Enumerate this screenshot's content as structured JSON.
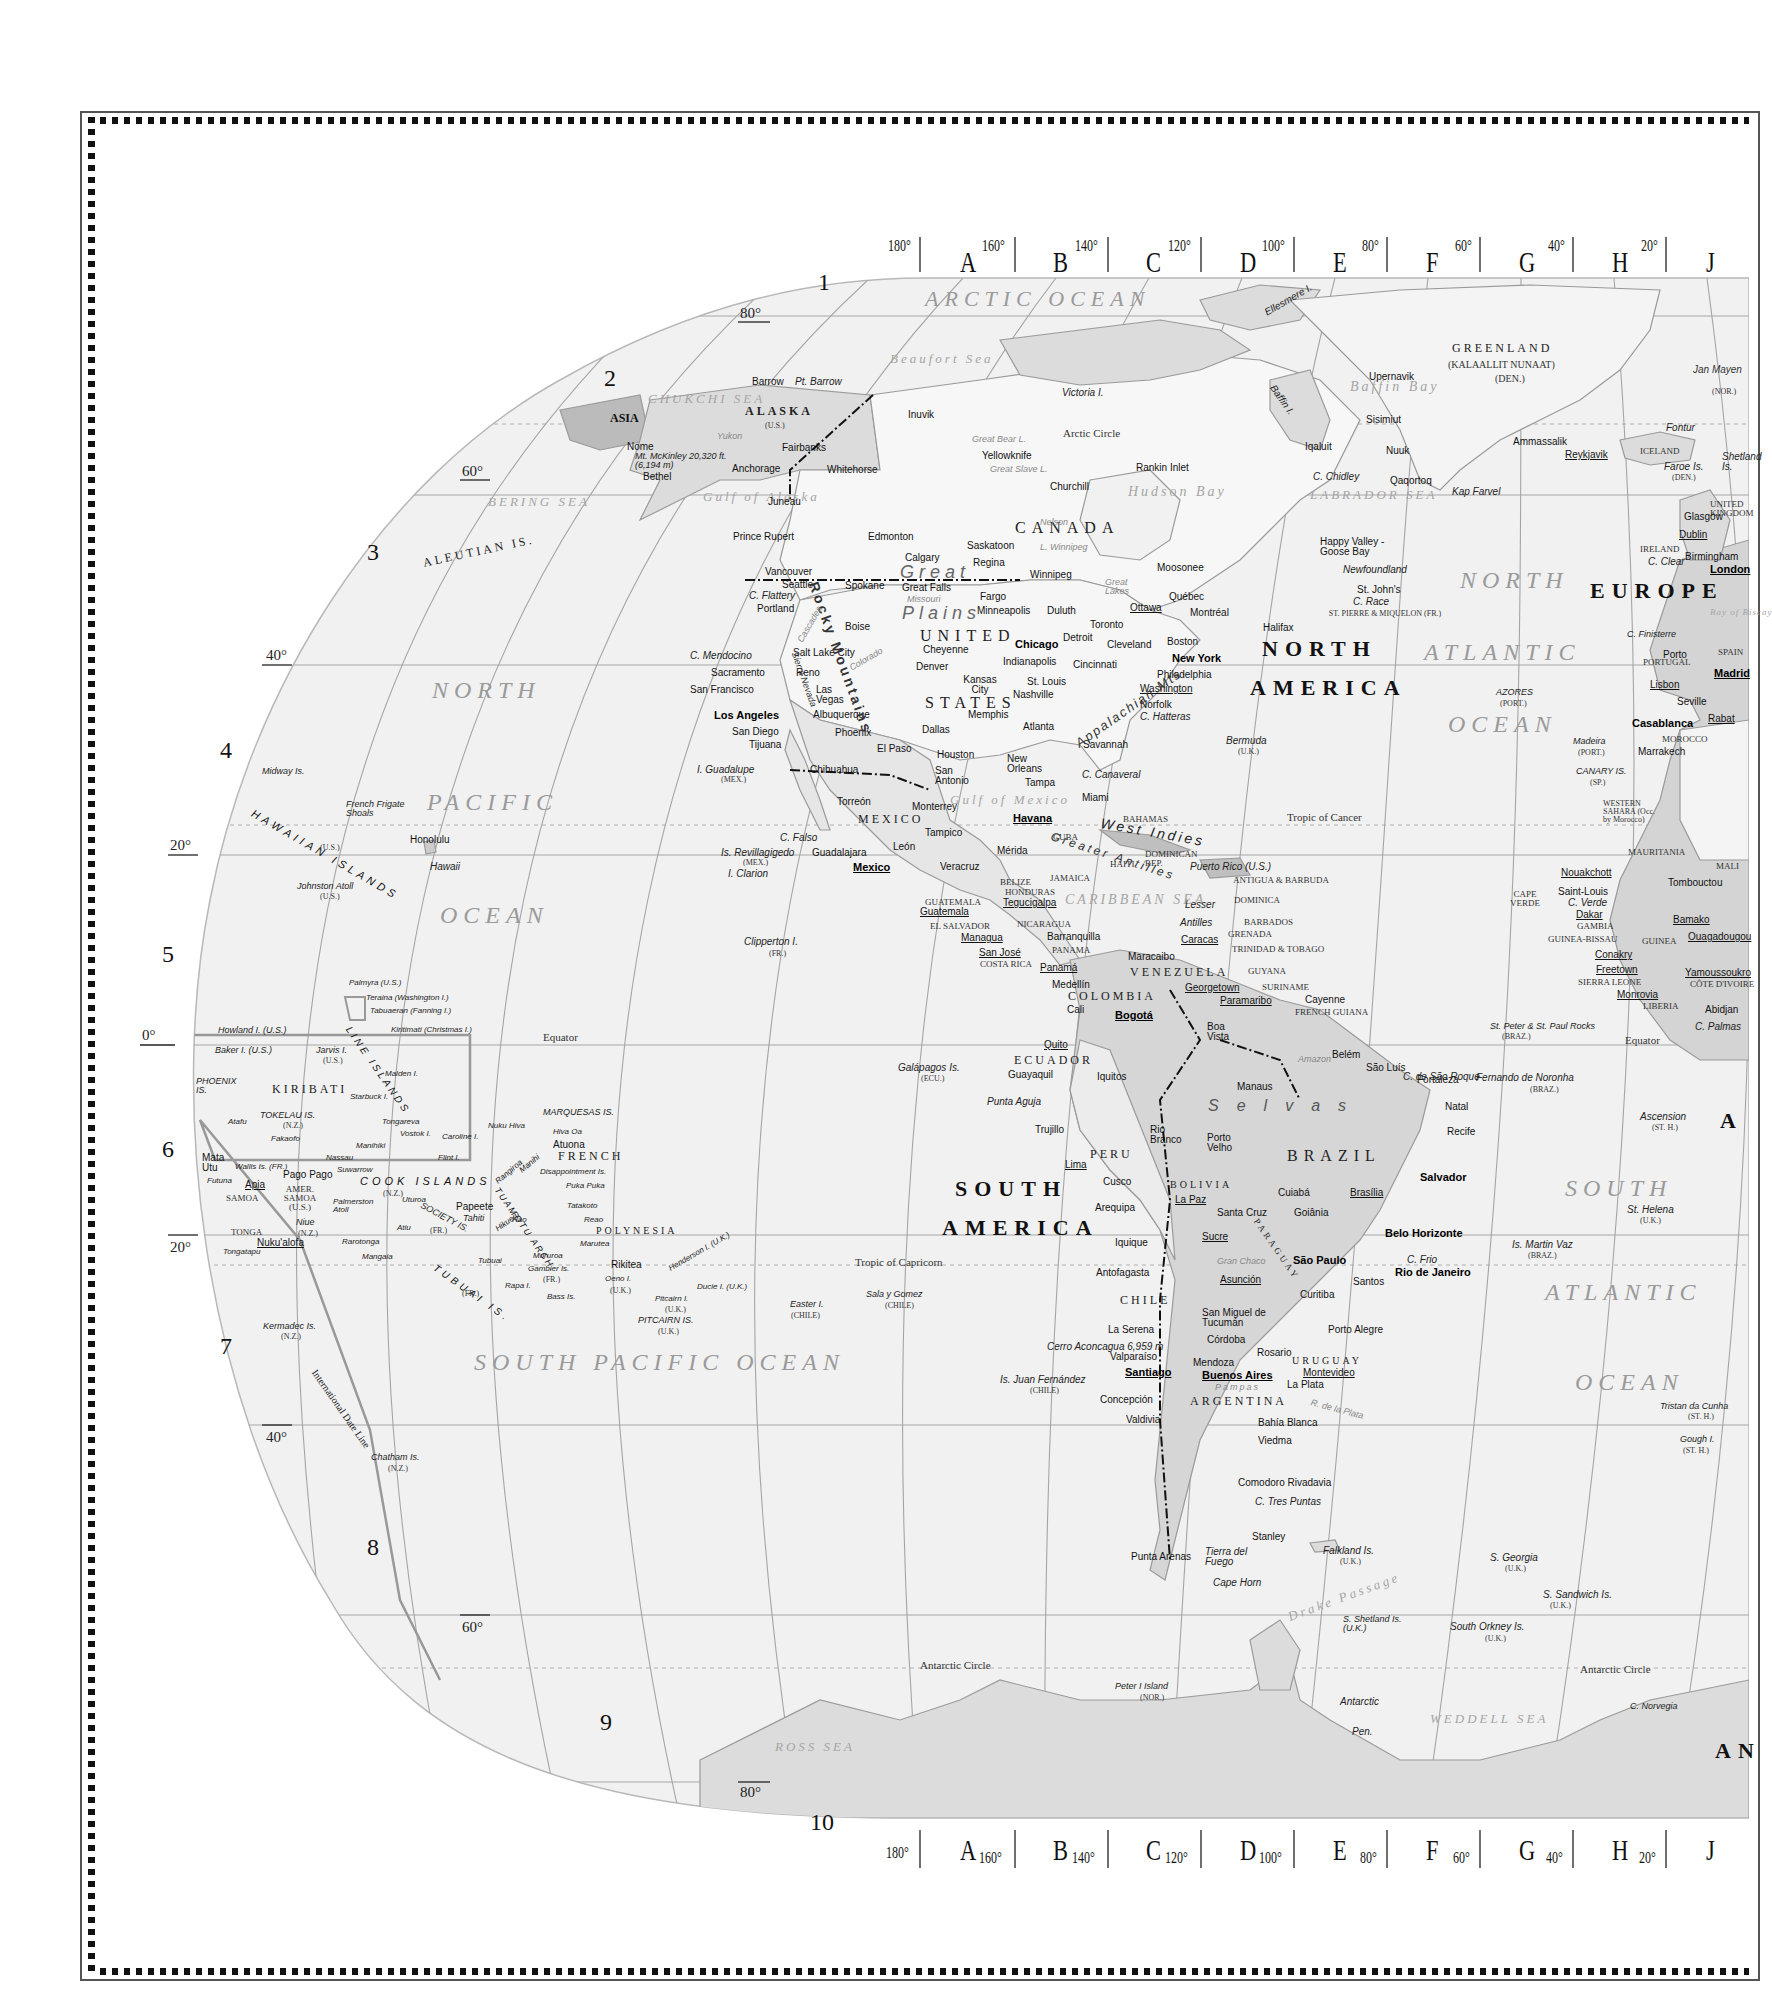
{
  "map": {
    "type": "world map (Western Hemisphere section)",
    "grid_columns": {
      "letters": [
        "A",
        "B",
        "C",
        "D",
        "E",
        "F",
        "G",
        "H",
        "J"
      ],
      "top_degrees": [
        "180°",
        "160°",
        "140°",
        "120°",
        "100°",
        "80°",
        "60°",
        "40°",
        "20°"
      ],
      "bottom_degrees": [
        "180°",
        "160°",
        "140°",
        "120°",
        "100°",
        "80°",
        "60°",
        "40°",
        "20°"
      ]
    },
    "grid_rows": [
      "1",
      "2",
      "3",
      "4",
      "5",
      "6",
      "7",
      "8",
      "9",
      "10"
    ],
    "latitude_labels": {
      "n80": "80°",
      "n60": "60°",
      "n40": "40°",
      "n20": "20°",
      "eq": "0°",
      "s20": "20°",
      "s40": "40°",
      "s60": "60°",
      "s80": "80°"
    },
    "lines": {
      "arctic_circle": "Arctic Circle",
      "tropic_cancer": "Tropic of Cancer",
      "equator": "Equator",
      "tropic_capricorn": "Tropic of Capricorn",
      "antarctic_circle": "Antarctic Circle",
      "date_line": "International Date Line"
    },
    "continents": {
      "north_america_1": "NORTH",
      "north_america_2": "AMERICA",
      "south_america_1": "SOUTH",
      "south_america_2": "AMERICA",
      "europe": "EUROPE",
      "asia": "ASIA",
      "africa_partial": "A",
      "antarctica_partial": "AN"
    },
    "oceans": {
      "arctic": "ARCTIC OCEAN",
      "north_pacific_1": "NORTH",
      "north_pacific_2": "PACIFIC",
      "north_pacific_3": "OCEAN",
      "south_pacific": "SOUTH PACIFIC OCEAN",
      "north_atlantic_1": "NORTH",
      "north_atlantic_2": "ATLANTIC",
      "north_atlantic_3": "OCEAN",
      "south_atlantic_1": "SOUTH",
      "south_atlantic_2": "ATLANTIC",
      "south_atlantic_3": "OCEAN"
    },
    "seas": {
      "beaufort": "Beaufort Sea",
      "chukchi": "CHUKCHI SEA",
      "bering": "BERING SEA",
      "gulf_alaska": "Gulf of Alaska",
      "hudson": "Hudson Bay",
      "baffin": "Baffin Bay",
      "labrador": "LABRADOR SEA",
      "gulf_mexico": "Gulf of Mexico",
      "caribbean": "CARIBBEAN SEA",
      "weddell": "WEDDELL SEA",
      "ross": "ROSS SEA",
      "drake": "Drake Passage",
      "biscay": "Bay of Biscay"
    },
    "countries": {
      "canada": "CANADA",
      "united": "UNITED",
      "states": "STATES",
      "alaska": "ALASKA",
      "alaska_us": "(U.S.)",
      "greenland": "GREENLAND",
      "greenland_alt": "(KALAALLIT NUNAAT)",
      "greenland_den": "(DEN.)",
      "iceland": "ICELAND",
      "mexico": "MEXICO",
      "cuba": "CUBA",
      "bahamas": "BAHAMAS",
      "haiti": "HAITI",
      "dominican_rep": "DOMINICAN REP.",
      "jamaica": "JAMAICA",
      "belize": "BELIZE",
      "honduras": "HONDURAS",
      "guatemala": "GUATEMALA",
      "el_salvador": "EL SALVADOR",
      "nicaragua": "NICARAGUA",
      "costa_rica": "COSTA RICA",
      "panama": "PANAMA",
      "colombia": "COLOMBIA",
      "venezuela": "VENEZUELA",
      "guyana": "GUYANA",
      "suriname": "SURINAME",
      "french_guiana": "FRENCH GUIANA",
      "ecuador": "ECUADOR",
      "peru": "PERU",
      "brazil": "BRAZIL",
      "bolivia": "BOLIVIA",
      "paraguay": "PARAGUAY",
      "chile": "CHILE",
      "argentina": "ARGENTINA",
      "uruguay": "URUGUAY",
      "ireland": "IRELAND",
      "united_kingdom": "UNITED KINGDOM",
      "portugal": "PORTUGAL",
      "spain": "SPAIN",
      "morocco": "MOROCCO",
      "western_sahara": "WESTERN SAHARA (Occ. by Morocco)",
      "mauritania": "MAURITANIA",
      "mali": "MALI",
      "cape_verde": "CAPE VERDE",
      "gambia": "GAMBIA",
      "guinea_bissau": "GUINEA-BISSAU",
      "guinea": "GUINEA",
      "sierra_leone": "SIERRA LEONE",
      "liberia": "LIBERIA",
      "cote_divoire": "CÔTE D'IVOIRE",
      "kiribati": "KIRIBATI",
      "french_polynesia_1": "FRENCH",
      "french_polynesia_2": "POLYNESIA",
      "samoa": "SAMOA",
      "amer_samoa": "AMER. SAMOA (U.S.)",
      "tonga": "TONGA",
      "antigua": "ANTIGUA & BARBUDA",
      "dominica": "DOMINICA",
      "barbados": "BARBADOS",
      "grenada": "GRENADA",
      "trinidad": "TRINIDAD & TOBAGO",
      "st_pierre": "ST. PIERRE & MIQUELON (FR.)"
    },
    "cities": {
      "barrow": "Barrow",
      "nome": "Nome",
      "bethel": "Bethel",
      "anchorage": "Anchorage",
      "fairbanks": "Fairbanks",
      "juneau": "Juneau",
      "whitehorse": "Whitehorse",
      "inuvik": "Inuvik",
      "yellowknife": "Yellowknife",
      "prince_rupert": "Prince Rupert",
      "edmonton": "Edmonton",
      "calgary": "Calgary",
      "saskatoon": "Saskatoon",
      "regina": "Regina",
      "winnipeg": "Winnipeg",
      "churchill": "Churchill",
      "rankin_inlet": "Rankin Inlet",
      "iqaluit": "Iqaluit",
      "moosonee": "Moosonee",
      "quebec": "Québec",
      "ottawa": "Ottawa",
      "montreal": "Montréal",
      "toronto": "Toronto",
      "halifax": "Halifax",
      "st_johns": "St. John's",
      "happy_valley": "Happy Valley - Goose Bay",
      "vancouver": "Vancouver",
      "seattle": "Seattle",
      "spokane": "Spokane",
      "portland": "Portland",
      "great_falls": "Great Falls",
      "fargo": "Fargo",
      "minneapolis": "Minneapolis",
      "duluth": "Duluth",
      "boise": "Boise",
      "salt_lake": "Salt Lake City",
      "cheyenne": "Cheyenne",
      "denver": "Denver",
      "reno": "Reno",
      "sacramento": "Sacramento",
      "san_francisco": "San Francisco",
      "las_vegas": "Las Vegas",
      "los_angeles": "Los Angeles",
      "san_diego": "San Diego",
      "tijuana": "Tijuana",
      "phoenix": "Phoenix",
      "albuquerque": "Albuquerque",
      "el_paso": "El Paso",
      "kansas_city": "Kansas City",
      "st_louis": "St. Louis",
      "chicago": "Chicago",
      "detroit": "Detroit",
      "cleveland": "Cleveland",
      "indianapolis": "Indianapolis",
      "cincinnati": "Cincinnati",
      "nashville": "Nashville",
      "memphis": "Memphis",
      "dallas": "Dallas",
      "houston": "Houston",
      "san_antonio": "San Antonio",
      "new_orleans": "New Orleans",
      "atlanta": "Atlanta",
      "savannah": "Savannah",
      "tampa": "Tampa",
      "miami": "Miami",
      "norfolk": "Norfolk",
      "washington": "Washington",
      "philadelphia": "Philadelphia",
      "new_york": "New York",
      "boston": "Boston",
      "chihuahua": "Chihuahua",
      "torreon": "Torreón",
      "monterrey": "Monterrey",
      "tampico": "Tampico",
      "guadalajara": "Guadalajara",
      "leon": "León",
      "mexico_city": "Mexico",
      "veracruz": "Veracruz",
      "merida": "Mérida",
      "havana": "Havana",
      "guatemala": "Guatemala",
      "tegucigalpa": "Tegucigalpa",
      "managua": "Managua",
      "san_jose": "San José",
      "panama": "Panamá",
      "barranquilla": "Barranquilla",
      "maracaibo": "Maracaibo",
      "caracas": "Caracas",
      "medellin": "Medellín",
      "cali": "Cali",
      "bogota": "Bogotá",
      "georgetown": "Georgetown",
      "paramaribo": "Paramaribo",
      "cayenne": "Cayenne",
      "quito": "Quito",
      "guayaquil": "Guayaquil",
      "iquitos": "Iquitos",
      "boa_vista": "Boa Vista",
      "manaus": "Manaus",
      "belem": "Belém",
      "sao_luis": "São Luís",
      "fortaleza": "Fortaleza",
      "natal": "Natal",
      "recife": "Recife",
      "salvador": "Salvador",
      "trujillo": "Trujillo",
      "lima": "Lima",
      "cusco": "Cusco",
      "arequipa": "Arequipa",
      "rio_branco": "Rio Branco",
      "porto_velho": "Porto Velho",
      "la_paz": "La Paz",
      "santa_cruz": "Santa Cruz",
      "sucre": "Sucre",
      "cuiaba": "Cuiabá",
      "brasilia": "Brasília",
      "goiania": "Goiânia",
      "belo_horizonte": "Belo Horizonte",
      "sao_paulo": "São Paulo",
      "rio": "Rio de Janeiro",
      "santos": "Santos",
      "curitiba": "Curitiba",
      "porto_alegre": "Porto Alegre",
      "iquique": "Iquique",
      "antofagasta": "Antofagasta",
      "asuncion": "Asunción",
      "tucuman": "San Miguel de Tucumán",
      "cordoba": "Córdoba",
      "la_serena": "La Serena",
      "valparaiso": "Valparaíso",
      "santiago": "Santiago",
      "mendoza": "Mendoza",
      "rosario": "Rosario",
      "buenos_aires": "Buenos Aires",
      "montevideo": "Montevideo",
      "la_plata": "La Plata",
      "concepcion": "Concepción",
      "valdivia": "Valdivia",
      "bahia_blanca": "Bahía Blanca",
      "viedma": "Viedma",
      "comodoro": "Comodoro Rivadavia",
      "punta_arenas": "Punta Arenas",
      "stanley": "Stanley",
      "upernavik": "Upernavik",
      "sisimiut": "Sisimiut",
      "nuuk": "Nuuk",
      "qaqortoq": "Qaqortoq",
      "ammassalik": "Ammassalik",
      "reykjavik": "Reykjavik",
      "glasgow": "Glasgow",
      "dublin": "Dublin",
      "birmingham": "Birmingham",
      "london": "London",
      "porto": "Porto",
      "lisbon": "Lisbon",
      "seville": "Seville",
      "madrid": "Madrid",
      "casablanca": "Casablanca",
      "rabat": "Rabat",
      "marrakech": "Marrakech",
      "nouakchott": "Nouakchott",
      "saint_louis": "Saint-Louis",
      "dakar": "Dakar",
      "tombouctou": "Tombouctou",
      "bamako": "Bamako",
      "ouagadougou": "Ouagadougou",
      "conakry": "Conakry",
      "freetown": "Freetown",
      "monrovia": "Monrovia",
      "yamoussoukro": "Yamoussoukro",
      "abidjan": "Abidjan",
      "honolulu": "Honolulu",
      "papeete": "Papeete",
      "atuona": "Atuona",
      "apia": "Apia",
      "pago_pago": "Pago Pago",
      "nukualofa": "Nuku'alofa",
      "mata_utu": "Mata Utu",
      "rikitea": "Rikitea"
    },
    "features": {
      "mckinley": "Mt. McKinley 20,320 ft. (6,194 m)",
      "pt_barrow": "Pt. Barrow",
      "aleutian": "ALEUTIAN IS.",
      "victoria_i": "Victoria I.",
      "ellesmere": "Ellesmere I.",
      "baffin_i": "Baffin I.",
      "c_chidley": "C. Chidley",
      "kap_farvel": "Kap Farvel",
      "newfoundland": "Newfoundland",
      "c_race": "C. Race",
      "jan_mayen": "Jan Mayen",
      "jan_mayen_nor": "(NOR.)",
      "fontur": "Fontur",
      "faroe": "Faroe Is.",
      "faroe_den": "(DEN.)",
      "c_clear": "C. Clear",
      "great_bear": "Great Bear L.",
      "great_slave": "Great Slave L.",
      "l_winnipeg": "L. Winnipeg",
      "great_lakes": "Great Lakes",
      "great_plains_1": "Great",
      "great_plains_2": "Plains",
      "rocky_mts": "Rocky Mountains",
      "cascades": "Cascades",
      "sierra_nevada": "Sierra Nevada",
      "appalachian": "Appalachian Mts.",
      "c_flattery": "C. Flattery",
      "c_mendocino": "C. Mendocino",
      "c_hatteras": "C. Hatteras",
      "c_canaveral": "C. Canaveral",
      "bermuda": "Bermuda",
      "bermuda_uk": "(U.K.)",
      "i_guadalupe": "I. Guadalupe",
      "i_guadalupe_mex": "(MEX.)",
      "c_falso": "C. Falso",
      "revillagigedo": "Is. Revillagigedo",
      "revillagigedo_mex": "(MEX.)",
      "i_clarion": "I. Clarion",
      "west_indies": "West Indies",
      "greater_antilles": "Greater Antilles",
      "lesser_antilles_1": "Lesser",
      "lesser_antilles_2": "Antilles",
      "puerto_rico": "Puerto Rico (U.S.)",
      "clipperton": "Clipperton I.",
      "clipperton_fr": "(FR.)",
      "galapagos": "Galápagos Is.",
      "galapagos_ecu": "(ECU.)",
      "punta_aguja": "Punta Aguja",
      "andes": "Andes",
      "selvas": "Selvas",
      "amazon": "Amazon",
      "gran_chaco": "Gran Chaco",
      "pampas": "Pampas",
      "aconcagua": "Cerro Aconcagua 6,959 m",
      "juan_fernandez": "Is. Juan Fernández",
      "juan_fernandez_chile": "(CHILE)",
      "rio_de_la_plata": "R. de la Plata",
      "c_tres_puntas": "C. Tres Puntas",
      "tierra_del_fuego": "Tierra del Fuego",
      "cape_horn": "Cape Horn",
      "falkland": "Falkland Is.",
      "falkland_uk": "(U.K.)",
      "s_georgia": "S. Georgia",
      "s_georgia_uk": "(U.K.)",
      "s_sandwich": "S. Sandwich Is.",
      "s_sandwich_uk": "(U.K.)",
      "s_shetland": "S. Shetland Is. (U.K.)",
      "s_orkney": "South Orkney Is.",
      "s_orkney_uk": "(U.K.)",
      "peter_i": "Peter I Island",
      "peter_i_nor": "(NOR.)",
      "antarctic_pen_1": "Antarctic",
      "antarctic_pen_2": "Pen.",
      "c_norvegia": "C. Norvegia",
      "c_frio": "C. Frio",
      "c_sao_roque": "C. de São Roque",
      "fernando_noronha": "Fernando de Noronha",
      "fernando_noronha_braz": "(BRAZ.)",
      "st_peter_paul": "St. Peter & St. Paul Rocks",
      "st_peter_paul_braz": "(BRAZ.)",
      "ascension": "Ascension",
      "ascension_sth": "(ST. H.)",
      "st_helena": "St. Helena",
      "st_helena_uk": "(U.K.)",
      "martin_vaz": "Is. Martin Vaz",
      "martin_vaz_braz": "(BRAZ.)",
      "tristan": "Tristan da Cunha",
      "tristan_sth": "(ST. H.)",
      "gough": "Gough I.",
      "gough_sth": "(ST. H.)",
      "azores": "AZORES",
      "azores_port": "(PORT.)",
      "madeira": "Madeira",
      "madeira_port": "(PORT.)",
      "canary": "CANARY IS.",
      "canary_sp": "(SP.)",
      "c_finisterre": "C. Finisterre",
      "c_verde": "C. Verde",
      "c_palmas": "C. Palmas",
      "atlas": "Atlas",
      "shetland": "Shetland Is.",
      "midway": "Midway Is.",
      "hawaiian": "HAWAIIAN ISLANDS",
      "hawaiian_us": "(U.S.)",
      "french_frigate": "French Frigate Shoals",
      "hawaii": "Hawaii",
      "johnston": "Johnston Atoll",
      "johnston_us": "(U.S.)",
      "palmyra": "Palmyra (U.S.)",
      "teraina": "Teraina (Washington I.)",
      "tabuaeran": "Tabuaeran (Fanning I.)",
      "kiritimati": "Kiritimati (Christmas I.)",
      "howland": "Howland I. (U.S.)",
      "baker": "Baker I. (U.S.)",
      "jarvis": "Jarvis I.",
      "jarvis_us": "(U.S.)",
      "line_islands": "LINE ISLANDS",
      "phoenix": "PHOENIX IS.",
      "malden": "Malden I.",
      "starbuck": "Starbuck I.",
      "tokelau": "TOKELAU IS.",
      "tokelau_nz": "(N.Z.)",
      "atafu": "Atafu",
      "fakaofo": "Fakaofo",
      "tongareva": "Tongareva",
      "vostok": "Vostok I.",
      "caroline": "Caroline I.",
      "flint": "Flint I.",
      "manihiki": "Manihiki",
      "nassau": "Nassau",
      "suwarrow": "Suwarrow",
      "cook_islands": "COOK ISLANDS",
      "cook_nz": "(N.Z.)",
      "palmerston": "Palmerston Atoll",
      "wallis": "Wallis Is. (FR.)",
      "futuna": "Futuna",
      "niue": "Niue",
      "niue_nz": "(N.Z.)",
      "tongatapu": "Tongatapu",
      "rarotonga": "Rarotonga",
      "atiu": "Atiu",
      "mangaia": "Mangaia",
      "uturoa": "Uturoa",
      "society": "SOCIETY IS.",
      "society_fr": "(FR.)",
      "tahiti": "Tahiti",
      "marquesas": "MARQUESAS IS.",
      "nuku_hiva": "Nuku Hiva",
      "hiva_oa": "Hiva Oa",
      "rangiroa": "Rangiroa",
      "manihi": "Manihi",
      "disappointment": "Disappointment Is.",
      "puka_puka": "Puka Puka",
      "tuamotu": "TUAMOTU ARCH.",
      "tatakoto": "Tatakoto",
      "reao": "Reao",
      "hikueru": "Hikueru",
      "hao": "Hao",
      "marutea": "Marutea",
      "tubuai_is": "TUBUAI IS.",
      "tubuai_fr": "(FR.)",
      "tubuai": "Tubuai",
      "rapa": "Rapa I.",
      "bass": "Bass Is.",
      "mururoa": "Mururoa",
      "gambier": "Gambier Is.",
      "gambier_fr": "(FR.)",
      "oeno": "Oeno I.",
      "oeno_uk": "(U.K.)",
      "henderson": "Henderson I. (U.K.)",
      "ducie": "Ducie I. (U.K.)",
      "pitcairn_i": "Pitcairn I.",
      "pitcairn_i_uk": "(U.K.)",
      "pitcairn_is": "PITCAIRN IS.",
      "pitcairn_is_uk": "(U.K.)",
      "easter": "Easter I.",
      "easter_chile": "(CHILE)",
      "sala_gomez": "Sala y Gomez",
      "sala_gomez_chile": "(CHILE)",
      "kermadec": "Kermadec Is.",
      "kermadec_nz": "(N.Z.)",
      "chatham": "Chatham Is.",
      "chatham_nz": "(N.Z.)",
      "yukon": "Yukon",
      "mackenzie": "Mackenzie",
      "nelson": "Nelson",
      "missouri": "Missouri",
      "colorado": "Colorado",
      "arkansas": "Arkansas",
      "mississippi": "Mississippi",
      "rio_grande": "Rio Grande",
      "st_lawrence": "St. Lawrence",
      "parana": "Paraná"
    }
  }
}
